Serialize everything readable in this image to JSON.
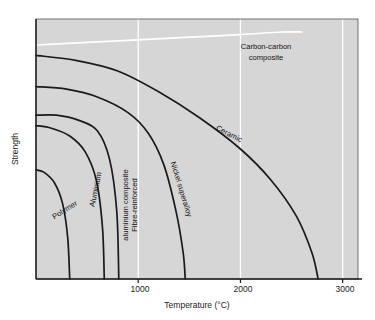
{
  "chart_data": {
    "type": "line",
    "title": "",
    "xlabel": "Temperature (°C)",
    "ylabel": "Strength",
    "xlim": [
      0,
      3150
    ],
    "ylim": [
      0,
      100
    ],
    "xticks": [
      1000,
      2000,
      3000
    ],
    "xtick_labels": [
      "1000",
      "2000",
      "3000"
    ],
    "yticks": [],
    "ytick_labels": [],
    "grid": "vertical white gridlines at x ticks",
    "legend": "inline curve labels",
    "plot_background": "#d6d6d6",
    "series": [
      {
        "name": "Carbon-carbon composite",
        "color": "#ffffff",
        "label": "Carbon-carbon composite",
        "label_line1": "Carbon-carbon",
        "label_line2": "composite",
        "points": [
          {
            "x": 0,
            "y": 90
          },
          {
            "x": 500,
            "y": 91
          },
          {
            "x": 1000,
            "y": 92
          },
          {
            "x": 1500,
            "y": 93
          },
          {
            "x": 2000,
            "y": 94
          },
          {
            "x": 2400,
            "y": 95
          },
          {
            "x": 2600,
            "y": 95
          }
        ]
      },
      {
        "name": "Ceramic",
        "color": "#1a1a1a",
        "label": "Ceramic",
        "points": [
          {
            "x": 0,
            "y": 86
          },
          {
            "x": 400,
            "y": 84
          },
          {
            "x": 800,
            "y": 80
          },
          {
            "x": 1200,
            "y": 72
          },
          {
            "x": 1600,
            "y": 62
          },
          {
            "x": 2000,
            "y": 50
          },
          {
            "x": 2300,
            "y": 38
          },
          {
            "x": 2550,
            "y": 24
          },
          {
            "x": 2700,
            "y": 10
          },
          {
            "x": 2760,
            "y": 0
          }
        ]
      },
      {
        "name": "Nickel superalloy",
        "color": "#1a1a1a",
        "label": "Nickel superalloy",
        "points": [
          {
            "x": 0,
            "y": 74
          },
          {
            "x": 300,
            "y": 73
          },
          {
            "x": 600,
            "y": 70
          },
          {
            "x": 900,
            "y": 64
          },
          {
            "x": 1100,
            "y": 56
          },
          {
            "x": 1250,
            "y": 44
          },
          {
            "x": 1370,
            "y": 26
          },
          {
            "x": 1440,
            "y": 10
          },
          {
            "x": 1460,
            "y": 0
          }
        ]
      },
      {
        "name": "Fibre-reinforced aluminium composite",
        "color": "#1a1a1a",
        "label": "Fibre-reinforced aluminium composite",
        "label_line1": "Fibre-reinforced",
        "label_line2": "aluminium composite",
        "points": [
          {
            "x": 0,
            "y": 63
          },
          {
            "x": 200,
            "y": 63
          },
          {
            "x": 420,
            "y": 61
          },
          {
            "x": 600,
            "y": 57
          },
          {
            "x": 720,
            "y": 46
          },
          {
            "x": 790,
            "y": 26
          },
          {
            "x": 810,
            "y": 0
          }
        ]
      },
      {
        "name": "Aluminium",
        "color": "#1a1a1a",
        "label": "Aluminium",
        "points": [
          {
            "x": 0,
            "y": 59
          },
          {
            "x": 150,
            "y": 58
          },
          {
            "x": 330,
            "y": 55
          },
          {
            "x": 480,
            "y": 49
          },
          {
            "x": 590,
            "y": 38
          },
          {
            "x": 650,
            "y": 20
          },
          {
            "x": 668,
            "y": 0
          }
        ]
      },
      {
        "name": "Polymer",
        "color": "#1a1a1a",
        "label": "Polymer",
        "points": [
          {
            "x": 0,
            "y": 42
          },
          {
            "x": 80,
            "y": 41
          },
          {
            "x": 180,
            "y": 37
          },
          {
            "x": 260,
            "y": 29
          },
          {
            "x": 310,
            "y": 16
          },
          {
            "x": 330,
            "y": 0
          }
        ]
      }
    ]
  }
}
